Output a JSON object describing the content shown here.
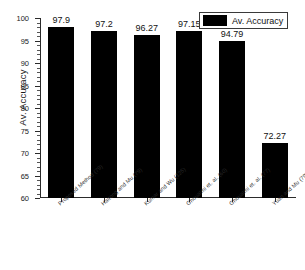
{
  "chart_data": {
    "type": "bar",
    "title": "",
    "xlabel": "",
    "ylabel": "Av. Accuracy",
    "ylim": [
      60,
      100
    ],
    "ytick_step": 5,
    "yticks": [
      60,
      65,
      70,
      75,
      80,
      85,
      90,
      95,
      100
    ],
    "grid": false,
    "legend_position": "top-right",
    "legend": [
      "Av. Accuracy"
    ],
    "bar_color": "#000000",
    "categories": [
      "Proposed Method (79)",
      "Haitong and Mu (79)",
      "Kumar and Wu (125)",
      "Ghoualmi et. al. (60)",
      "Ghoualmi et. al. (77)",
      "Yuan and Mu (79)"
    ],
    "values": [
      97.9,
      97.2,
      96.27,
      97.15,
      94.79,
      72.27
    ],
    "value_labels": [
      "97.9",
      "97.2",
      "96.27",
      "97.15",
      "94.79",
      "72.27"
    ],
    "series": [
      {
        "name": "Av. Accuracy",
        "values": [
          97.9,
          97.2,
          96.27,
          97.15,
          94.79,
          72.27
        ]
      }
    ]
  },
  "axis": {
    "y_title": "Av. Accuracy",
    "y_tick_labels": [
      "100",
      "95",
      "90",
      "85",
      "80",
      "75",
      "70",
      "65",
      "60"
    ]
  },
  "legend": {
    "entry_label": "Av. Accuracy"
  }
}
